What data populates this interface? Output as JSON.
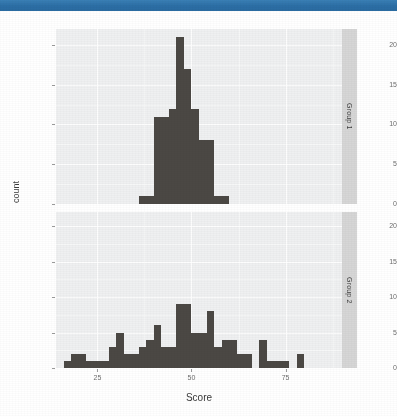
{
  "window": {
    "titlebar_color": "#2f74ab"
  },
  "chart_data": {
    "type": "bar",
    "title": "",
    "subtitle": "",
    "xlabel": "Score",
    "ylabel": "count",
    "xlim": [
      14,
      90
    ],
    "ylim": [
      0,
      22
    ],
    "xticks": [
      25,
      50,
      75
    ],
    "xtick_labels": [
      "25",
      "50",
      "75"
    ],
    "yticks": [
      0,
      5,
      10,
      15,
      20
    ],
    "ytick_labels": [
      "0",
      "5",
      "10",
      "15",
      "20"
    ],
    "grid": true,
    "legend_position": "none",
    "bar_color": "#4b4844",
    "panel_background": "#eff0f1",
    "facet_strip_color": "#d6d6d6",
    "binwidth": 2,
    "facets": [
      {
        "label": "Group 1",
        "bins": [
          {
            "x": 37,
            "count": 1
          },
          {
            "x": 39,
            "count": 1
          },
          {
            "x": 41,
            "count": 11
          },
          {
            "x": 43,
            "count": 11
          },
          {
            "x": 45,
            "count": 12
          },
          {
            "x": 47,
            "count": 21
          },
          {
            "x": 49,
            "count": 17
          },
          {
            "x": 51,
            "count": 12
          },
          {
            "x": 53,
            "count": 8
          },
          {
            "x": 55,
            "count": 8
          },
          {
            "x": 57,
            "count": 1
          },
          {
            "x": 59,
            "count": 1
          }
        ]
      },
      {
        "label": "Group 2",
        "bins": [
          {
            "x": 17,
            "count": 1
          },
          {
            "x": 19,
            "count": 2
          },
          {
            "x": 21,
            "count": 2
          },
          {
            "x": 23,
            "count": 1
          },
          {
            "x": 25,
            "count": 1
          },
          {
            "x": 27,
            "count": 1
          },
          {
            "x": 29,
            "count": 3
          },
          {
            "x": 31,
            "count": 5
          },
          {
            "x": 33,
            "count": 2
          },
          {
            "x": 35,
            "count": 2
          },
          {
            "x": 37,
            "count": 3
          },
          {
            "x": 39,
            "count": 4
          },
          {
            "x": 41,
            "count": 6
          },
          {
            "x": 43,
            "count": 3
          },
          {
            "x": 45,
            "count": 3
          },
          {
            "x": 47,
            "count": 9
          },
          {
            "x": 49,
            "count": 9
          },
          {
            "x": 51,
            "count": 5
          },
          {
            "x": 53,
            "count": 5
          },
          {
            "x": 55,
            "count": 8
          },
          {
            "x": 57,
            "count": 3
          },
          {
            "x": 59,
            "count": 4
          },
          {
            "x": 61,
            "count": 4
          },
          {
            "x": 63,
            "count": 2
          },
          {
            "x": 65,
            "count": 2
          },
          {
            "x": 69,
            "count": 4
          },
          {
            "x": 71,
            "count": 1
          },
          {
            "x": 73,
            "count": 1
          },
          {
            "x": 75,
            "count": 1
          },
          {
            "x": 79,
            "count": 2
          }
        ]
      }
    ]
  }
}
